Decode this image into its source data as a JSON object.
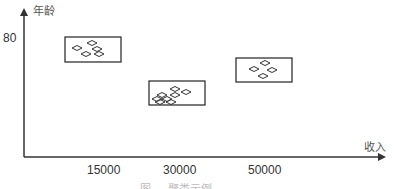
{
  "diagram": {
    "y_axis": {
      "label": "年龄",
      "ticks": [
        {
          "label": "80"
        }
      ]
    },
    "x_axis": {
      "label": "收入",
      "ticks": [
        {
          "label": "15000"
        },
        {
          "label": "30000"
        },
        {
          "label": "50000"
        }
      ]
    },
    "clusters": [
      {
        "name": "cluster-1",
        "box": {
          "x": 65,
          "y": 37,
          "w": 56,
          "h": 25
        },
        "points": [
          [
            92,
            43
          ],
          [
            77,
            48
          ],
          [
            97,
            49
          ],
          [
            86,
            54
          ],
          [
            99,
            54
          ]
        ]
      },
      {
        "name": "cluster-2",
        "box": {
          "x": 149,
          "y": 81,
          "w": 56,
          "h": 24
        },
        "points": [
          [
            175,
            89
          ],
          [
            186,
            92
          ],
          [
            162,
            95
          ],
          [
            175,
            95
          ],
          [
            157,
            99
          ],
          [
            167,
            99
          ],
          [
            160,
            102
          ],
          [
            171,
            102
          ]
        ]
      },
      {
        "name": "cluster-3",
        "box": {
          "x": 236,
          "y": 58,
          "w": 56,
          "h": 24
        },
        "points": [
          [
            265,
            63
          ],
          [
            254,
            69
          ],
          [
            272,
            70
          ],
          [
            263,
            76
          ]
        ]
      }
    ],
    "caption": "图 ... 聚类示例"
  },
  "colors": {
    "axis": "#333333",
    "box": "#333333",
    "point": "#333333",
    "background": "#ffffff"
  }
}
